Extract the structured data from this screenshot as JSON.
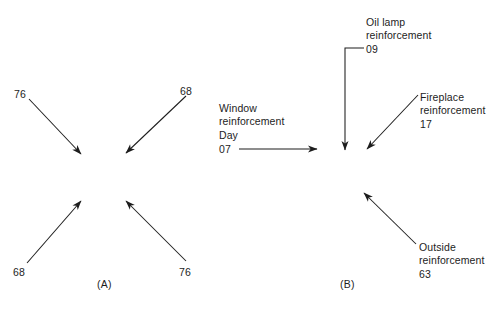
{
  "figure": {
    "background_color": "#ffffff",
    "ink_color": "#1d1d1d"
  },
  "panels": [
    {
      "tag": "(A)",
      "tag_x": 105,
      "tag_y": 283,
      "description": "four arrows converging toward a central point",
      "arrows": [
        {
          "name": "arrow-top-left",
          "label": "76",
          "label_x": 14,
          "label_y": 88,
          "x1": 29,
          "y1": 99,
          "x2": 81,
          "y2": 154
        },
        {
          "name": "arrow-top-right",
          "label": "68",
          "label_x": 180,
          "label_y": 85,
          "x1": 186,
          "y1": 96,
          "x2": 126,
          "y2": 153
        },
        {
          "name": "arrow-bottom-left",
          "label": "68",
          "label_x": 13,
          "label_y": 266,
          "x1": 27,
          "y1": 263,
          "x2": 81,
          "y2": 201
        },
        {
          "name": "arrow-bottom-right",
          "label": "76",
          "label_x": 179,
          "label_y": 266,
          "x1": 186,
          "y1": 261,
          "x2": 126,
          "y2": 201
        }
      ]
    },
    {
      "tag": "(B)",
      "tag_x": 348,
      "tag_y": 283,
      "description": "labelled reinforcement arrows",
      "annotations": [
        {
          "name": "window-reinforcement",
          "title": "Window\nreinforcement",
          "title_x": 219,
          "title_y": 102,
          "value_label": "Day",
          "value_label_x": 219,
          "value_label_y": 129,
          "value": "07",
          "value_x": 219,
          "value_y": 143,
          "arrow": {
            "x1": 239,
            "y1": 149,
            "x2": 317,
            "y2": 149
          }
        },
        {
          "name": "oil-lamp-reinforcement",
          "title": "Oil lamp\nreinforcement",
          "title_x": 366,
          "title_y": 16,
          "value": "09",
          "value_x": 366,
          "value_y": 43,
          "leader": {
            "x1": 364,
            "y1": 48,
            "x2": 345,
            "y2": 48
          },
          "arrow": {
            "x1": 345,
            "y1": 48,
            "x2": 345,
            "y2": 150
          }
        },
        {
          "name": "fireplace-reinforcement",
          "title": "Fireplace\nreinforcement",
          "title_x": 420,
          "title_y": 91,
          "value": "17",
          "value_x": 420,
          "value_y": 118,
          "arrow": {
            "x1": 418,
            "y1": 95,
            "x2": 367,
            "y2": 149
          }
        },
        {
          "name": "outside-reinforcement",
          "title": "Outside\nreinforcement",
          "title_x": 419,
          "title_y": 241,
          "value": "63",
          "value_x": 419,
          "value_y": 268,
          "arrow": {
            "x1": 416,
            "y1": 244,
            "x2": 364,
            "y2": 193
          }
        }
      ]
    }
  ]
}
